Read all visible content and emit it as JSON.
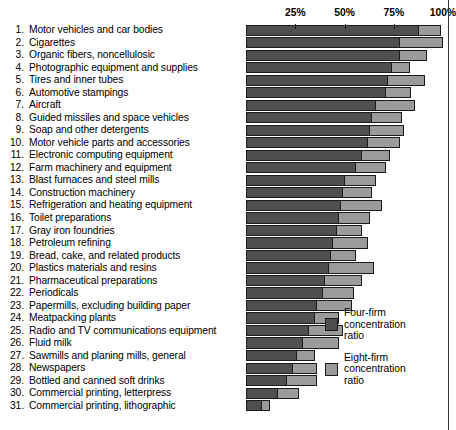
{
  "chart_data": {
    "type": "bar",
    "orientation": "horizontal",
    "title": "",
    "xlabel": "",
    "ylabel": "",
    "xlim": [
      0,
      100
    ],
    "grid": false,
    "legend_position": "inside-bottom-right",
    "axis_ticks": [
      {
        "value": 25,
        "label": "25%"
      },
      {
        "value": 50,
        "label": "50%"
      },
      {
        "value": 75,
        "label": "75%"
      },
      {
        "value": 100,
        "label": "100%"
      }
    ],
    "series": [
      {
        "name": "Four-firm concentration ratio",
        "legend_label": "Four-firm\nconcentration\nratio",
        "color": "#4f4f4f",
        "values": [
          88,
          78,
          78,
          74,
          72,
          71,
          66,
          64,
          63,
          62,
          59,
          56,
          50,
          49,
          48,
          47,
          46,
          44,
          43,
          42,
          40,
          39,
          36,
          35,
          32,
          29,
          26,
          24,
          21,
          16,
          8
        ]
      },
      {
        "name": "Eight-firm concentration ratio",
        "legend_label": "Eight-firm\nconcentration\nratio",
        "color": "#9b9b9b",
        "values": [
          99,
          100,
          92,
          83,
          91,
          84,
          86,
          79,
          80,
          78,
          73,
          71,
          66,
          64,
          69,
          63,
          59,
          62,
          56,
          65,
          59,
          55,
          54,
          47,
          49,
          47,
          35,
          36,
          36,
          27,
          12
        ]
      }
    ],
    "categories": [
      "Motor vehicles and car bodies",
      "Cigarettes",
      "Organic fibers, noncellulosic",
      "Photographic equipment and supplies",
      "Tires and inner tubes",
      "Automotive stampings",
      "Aircraft",
      "Guided missiles and space vehicles",
      "Soap and other detergents",
      "Motor vehicle parts and accessories",
      "Electronic computing equipment",
      "Farm machinery and equipment",
      "Blast furnaces and steel mills",
      "Construction machinery",
      "Refrigeration and heating equipment",
      "Toilet preparations",
      "Gray iron foundries",
      "Petroleum refining",
      "Bread, cake, and related products",
      "Plastics materials and resins",
      "Pharmaceutical preparations",
      "Periodicals",
      "Papermills, excluding building paper",
      "Meatpacking plants",
      "Radio and TV communications equipment",
      "Fluid milk",
      "Sawmills and planing mills, general",
      "Newspapers",
      "Bottled and canned soft drinks",
      "Commercial printing, letterpress",
      "Commercial printing, lithographic"
    ]
  },
  "legend": {
    "entries": [
      {
        "label": "Four-firm\nconcentration\nratio",
        "swatch": "four"
      },
      {
        "label": "Eight-firm\nconcentration\nratio",
        "swatch": "eight"
      }
    ]
  }
}
